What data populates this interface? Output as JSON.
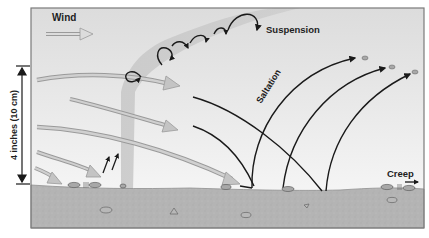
{
  "diagram": {
    "labels": {
      "wind": "Wind",
      "suspension": "Suspension",
      "saltation": "Saltation",
      "creep": "Creep",
      "height": "4 inches (10 cm)"
    },
    "colors": {
      "sky_top": "#d9d9d9",
      "sky_bottom": "#f4f4f4",
      "ground": "#b3b3b3",
      "ground_edge": "#8f8f8f",
      "wind_arrow": "#c4c4c4",
      "wind_arrow_outline": "#9a9a9a",
      "suspension_band": "#c2c2c2",
      "trajectory": "#1a1a1a",
      "frame": "#7a7a7a"
    },
    "processes": [
      {
        "name": "Suspension",
        "description": "fine particles carried aloft in looping paths"
      },
      {
        "name": "Saltation",
        "description": "grains bouncing in arcing trajectories"
      },
      {
        "name": "Creep",
        "description": "larger grains rolling along the surface"
      }
    ]
  }
}
